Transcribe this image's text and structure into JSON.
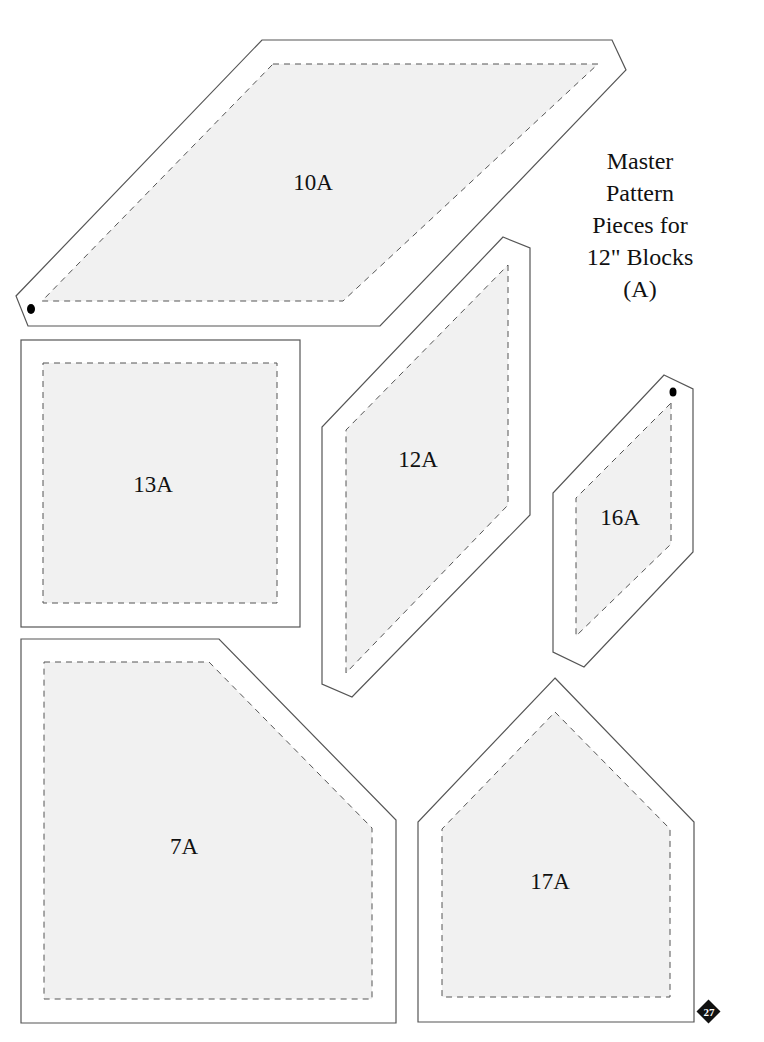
{
  "title": {
    "lines": [
      "Master",
      "Pattern",
      "Pieces for",
      "12\" Blocks",
      "(A)"
    ]
  },
  "pieces": [
    {
      "id": "10A",
      "label": "10A",
      "shape": "parallelogram",
      "has_dot": true
    },
    {
      "id": "13A",
      "label": "13A",
      "shape": "square",
      "has_dot": false
    },
    {
      "id": "12A",
      "label": "12A",
      "shape": "parallelogram",
      "has_dot": false
    },
    {
      "id": "16A",
      "label": "16A",
      "shape": "parallelogram",
      "has_dot": true
    },
    {
      "id": "7A",
      "label": "7A",
      "shape": "clipped-square",
      "has_dot": false
    },
    {
      "id": "17A",
      "label": "17A",
      "shape": "house-pentagon",
      "has_dot": false
    }
  ],
  "page_number": "27",
  "colors": {
    "fill": "#f1f1f1",
    "outline": "#555555",
    "text": "#111111"
  }
}
